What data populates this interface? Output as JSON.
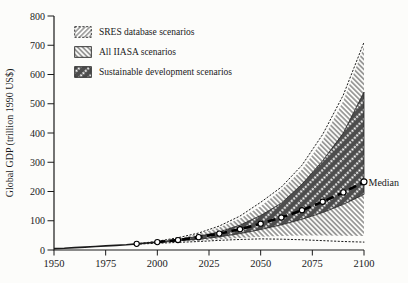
{
  "figure_title": "Global GDP scenario ranges, 1950-2100",
  "annotations": {
    "median_label": "Median"
  },
  "colors": {
    "ink": "#1a1a1a",
    "dark_band": "#4d4d4d",
    "hatch_line": "#2f2f2f",
    "marker_fill": "#ffffff",
    "background": "#fcfcfa"
  },
  "legend": {
    "items": [
      {
        "label": "SRES database scenarios",
        "pattern": "sres-hatch",
        "border": "dashed"
      },
      {
        "label": "All IIASA scenarios",
        "pattern": "iiasa-hatch",
        "border": "solid"
      },
      {
        "label": "Sustainable development scenarios",
        "pattern": "dark-stripes",
        "border": "solid"
      }
    ]
  },
  "chart_data": {
    "type": "area",
    "title": "",
    "xlabel": "",
    "ylabel": "Global GDP (trillion 1990 US$)",
    "xlim": [
      1950,
      2100
    ],
    "ylim": [
      0,
      800
    ],
    "x_ticks": [
      1950,
      1975,
      2000,
      2025,
      2050,
      2075,
      2100
    ],
    "y_ticks": [
      0,
      100,
      200,
      300,
      400,
      500,
      600,
      700,
      800
    ],
    "grid": false,
    "legend_position": "top-left",
    "bands": [
      {
        "name": "All IIASA scenarios",
        "pattern": "iiasa-hatch",
        "x": [
          1990,
          2000,
          2010,
          2020,
          2030,
          2040,
          2050,
          2060,
          2070,
          2080,
          2090,
          2100
        ],
        "upper": [
          21,
          29,
          40,
          55,
          77,
          108,
          150,
          205,
          275,
          375,
          510,
          695
        ],
        "lower": [
          21,
          24,
          28,
          32,
          37,
          41,
          45,
          48,
          50,
          50,
          49,
          48
        ]
      },
      {
        "name": "Sustainable development scenarios",
        "pattern": "dark-stripes",
        "x": [
          2000,
          2010,
          2020,
          2030,
          2040,
          2050,
          2060,
          2070,
          2080,
          2090,
          2100
        ],
        "upper": [
          27,
          36,
          47,
          62,
          85,
          118,
          160,
          225,
          305,
          400,
          540
        ],
        "lower": [
          26,
          31,
          37,
          45,
          56,
          70,
          86,
          105,
          128,
          156,
          190
        ]
      }
    ],
    "envelopes": [
      {
        "name": "SRES database scenarios upper bound",
        "style": "dotted",
        "x": [
          1990,
          2000,
          2010,
          2020,
          2030,
          2040,
          2050,
          2060,
          2070,
          2080,
          2090,
          2100
        ],
        "y": [
          21,
          30,
          42,
          58,
          82,
          116,
          163,
          215,
          290,
          395,
          530,
          710
        ]
      },
      {
        "name": "SRES database scenarios lower bound",
        "style": "dotted",
        "x": [
          1990,
          2000,
          2010,
          2020,
          2030,
          2040,
          2050,
          2060,
          2070,
          2080,
          2090,
          2100
        ],
        "y": [
          20,
          23,
          26,
          29,
          33,
          36,
          38,
          37,
          35,
          32,
          29,
          27
        ]
      }
    ],
    "series": [
      {
        "name": "Historical global GDP",
        "style": "solid",
        "x": [
          1950,
          1955,
          1960,
          1965,
          1970,
          1975,
          1980,
          1985,
          1990,
          1995,
          2000
        ],
        "y": [
          5,
          6,
          8,
          10,
          12,
          14,
          16,
          18,
          21,
          24,
          27
        ]
      },
      {
        "name": "Median",
        "style": "bold-dashed",
        "x": [
          2000,
          2010,
          2020,
          2030,
          2040,
          2050,
          2060,
          2070,
          2080,
          2090,
          2100
        ],
        "y": [
          27,
          34,
          44,
          56,
          71,
          90,
          111,
          136,
          165,
          197,
          233
        ]
      }
    ],
    "markers": {
      "name": "decade markers on historical + median line",
      "style": "open-circle",
      "x": [
        1990,
        2000,
        2010,
        2020,
        2030,
        2040,
        2050,
        2060,
        2070,
        2080,
        2090,
        2100
      ],
      "y": [
        21,
        27,
        34,
        44,
        56,
        71,
        90,
        111,
        136,
        165,
        197,
        233
      ]
    }
  }
}
